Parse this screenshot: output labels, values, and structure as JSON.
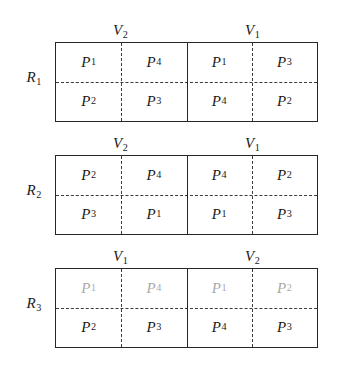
{
  "figure": {
    "rows": [
      {
        "row_label": "R",
        "row_index": "1",
        "halves": [
          {
            "v_label": "V",
            "v_index": "2",
            "cells": [
              {
                "p": "P",
                "i": "1",
                "faded": false
              },
              {
                "p": "P",
                "i": "4",
                "faded": false
              },
              {
                "p": "P",
                "i": "2",
                "faded": false
              },
              {
                "p": "P",
                "i": "3",
                "faded": false
              }
            ]
          },
          {
            "v_label": "V",
            "v_index": "1",
            "cells": [
              {
                "p": "P",
                "i": "1",
                "faded": false
              },
              {
                "p": "P",
                "i": "3",
                "faded": false
              },
              {
                "p": "P",
                "i": "4",
                "faded": false
              },
              {
                "p": "P",
                "i": "2",
                "faded": false
              }
            ]
          }
        ]
      },
      {
        "row_label": "R",
        "row_index": "2",
        "halves": [
          {
            "v_label": "V",
            "v_index": "2",
            "cells": [
              {
                "p": "P",
                "i": "2",
                "faded": false
              },
              {
                "p": "P",
                "i": "4",
                "faded": false
              },
              {
                "p": "P",
                "i": "3",
                "faded": false
              },
              {
                "p": "P",
                "i": "1",
                "faded": false
              }
            ]
          },
          {
            "v_label": "V",
            "v_index": "1",
            "cells": [
              {
                "p": "P",
                "i": "4",
                "faded": false
              },
              {
                "p": "P",
                "i": "2",
                "faded": false
              },
              {
                "p": "P",
                "i": "1",
                "faded": false
              },
              {
                "p": "P",
                "i": "3",
                "faded": false
              }
            ]
          }
        ]
      },
      {
        "row_label": "R",
        "row_index": "3",
        "halves": [
          {
            "v_label": "V",
            "v_index": "1",
            "cells": [
              {
                "p": "P",
                "i": "1",
                "faded": true
              },
              {
                "p": "P",
                "i": "4",
                "faded": true
              },
              {
                "p": "P",
                "i": "2",
                "faded": false
              },
              {
                "p": "P",
                "i": "3",
                "faded": false
              }
            ]
          },
          {
            "v_label": "V",
            "v_index": "2",
            "cells": [
              {
                "p": "P",
                "i": "1",
                "faded": true
              },
              {
                "p": "P",
                "i": "2",
                "faded": true
              },
              {
                "p": "P",
                "i": "4",
                "faded": false
              },
              {
                "p": "P",
                "i": "3",
                "faded": false
              }
            ]
          }
        ]
      }
    ],
    "colors": {
      "background": "#ffffff",
      "border": "#262626",
      "dashed": "#3a3a3a",
      "text": "#1b1b1b",
      "faded_text": "#9a9a9a"
    }
  }
}
